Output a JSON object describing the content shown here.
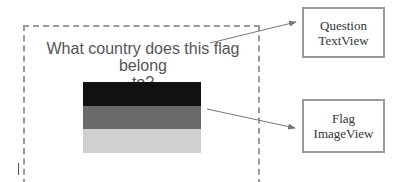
{
  "screen": {
    "question_line1": "What country does this flag belong",
    "question_line2": "to?",
    "flag": {
      "bands": [
        "#111111",
        "#6a6a6a",
        "#d0d0d0"
      ]
    }
  },
  "annotations": [
    {
      "line1": "Question",
      "line2": "TextView"
    },
    {
      "line1": "Flag",
      "line2": "ImageView"
    }
  ],
  "colors": {
    "frame_border": "#9a9a9a",
    "arrow": "#777777",
    "text": "#555555"
  }
}
